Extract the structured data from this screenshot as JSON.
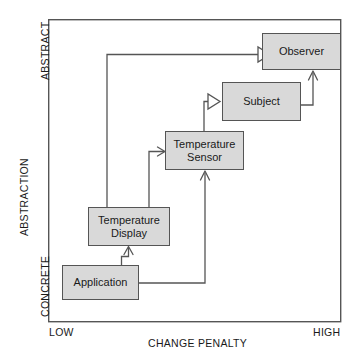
{
  "diagram": {
    "frame": {
      "x": 48,
      "y": 19,
      "width": 293,
      "height": 303,
      "border_color": "#555555"
    },
    "axes": {
      "y_axis_label": "ABSTRACTION",
      "y_top_label": "ABSTRACT",
      "y_bottom_label": "CONCRETE",
      "x_axis_label": "CHANGE PENALTY",
      "x_left_label": "LOW",
      "x_right_label": "HIGH"
    },
    "style": {
      "node_fill": "#d9d9d9",
      "node_border": "#555555",
      "connector_color": "#555555",
      "text_color": "#1a1a1a",
      "background": "#ffffff"
    },
    "nodes": [
      {
        "id": "observer",
        "label": "Observer",
        "x": 262,
        "y": 33,
        "width": 79,
        "height": 37
      },
      {
        "id": "subject",
        "label": "Subject",
        "x": 222,
        "y": 82,
        "width": 79,
        "height": 39
      },
      {
        "id": "sensor",
        "label": "Temperature\nSensor",
        "x": 165,
        "y": 131,
        "width": 79,
        "height": 39
      },
      {
        "id": "display",
        "label": "Temperature\nDisplay",
        "x": 88,
        "y": 207,
        "width": 82,
        "height": 39
      },
      {
        "id": "application",
        "label": "Application",
        "x": 62,
        "y": 265,
        "width": 77,
        "height": 35
      }
    ],
    "connectors": [
      {
        "id": "display-to-observer",
        "from": "display",
        "to": "observer",
        "arrow": "hollow-triangle",
        "path": "M107,207 L107,54.5 L258,54.5"
      },
      {
        "id": "sensor-to-subject",
        "from": "sensor",
        "to": "subject",
        "arrow": "hollow-triangle",
        "path": "M204,131 L204,101.5 L218,101.5"
      },
      {
        "id": "display-to-sensor",
        "from": "display",
        "to": "sensor",
        "arrow": "line-arrow",
        "path": "M149,207 L149,151 L163,151"
      },
      {
        "id": "application-to-display",
        "from": "application",
        "to": "display",
        "arrow": "line-arrow",
        "path": "M122,265 L122,256 L128.5,256 L128.5,248"
      },
      {
        "id": "application-to-sensor",
        "from": "application",
        "to": "sensor",
        "arrow": "line-arrow",
        "path": "M139,283 L205,283 L205,172"
      },
      {
        "id": "subject-to-observer",
        "from": "subject",
        "to": "observer",
        "arrow": "line-arrow",
        "path": "M301,105 L313,105 L313,72"
      }
    ]
  }
}
